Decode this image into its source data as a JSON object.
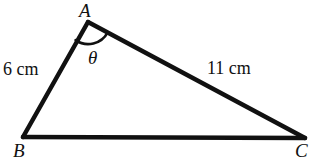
{
  "figure": {
    "type": "geometry-triangle-diagram",
    "background_color": "#ffffff",
    "stroke_color": "#111111",
    "stroke_width": 4,
    "vertices": {
      "A": {
        "label": "A",
        "x": 88,
        "y": 22
      },
      "B": {
        "label": "B",
        "x": 23,
        "y": 137
      },
      "C": {
        "label": "C",
        "x": 305,
        "y": 138
      }
    },
    "sides": {
      "ab": {
        "label": "6 cm",
        "value": 6,
        "unit": "cm",
        "from": "A",
        "to": "B"
      },
      "ac": {
        "label": "11 cm",
        "value": 11,
        "unit": "cm",
        "from": "A",
        "to": "C"
      },
      "bc": {
        "label": "",
        "from": "B",
        "to": "C"
      }
    },
    "angle": {
      "label": "θ",
      "at_vertex": "A",
      "marker": "arc",
      "arc_radius": 22
    }
  }
}
